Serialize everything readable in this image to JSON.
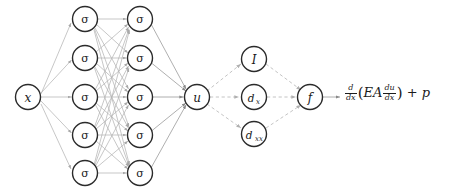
{
  "diagram": {
    "type": "neural-network-graph",
    "colors": {
      "background": "#ffffff",
      "node_stroke": "#2b2b2b",
      "node_fill": "#ffffff",
      "edge_solid": "#b4b4b4",
      "edge_dashed": "#bdbdbd",
      "text": "#1a1a1a"
    },
    "input": {
      "label": "x",
      "name": "input-node-x",
      "cx": 28,
      "cy": 97,
      "r": 12.5
    },
    "hidden_layers": [
      {
        "name": "hidden-layer-1",
        "cx": 85,
        "node_label": "σ",
        "nodes": [
          {
            "cy": 19
          },
          {
            "cy": 58
          },
          {
            "cy": 97
          },
          {
            "cy": 135
          },
          {
            "cy": 173
          }
        ]
      },
      {
        "name": "hidden-layer-2",
        "cx": 140,
        "node_label": "σ",
        "nodes": [
          {
            "cy": 19
          },
          {
            "cy": 58
          },
          {
            "cy": 97
          },
          {
            "cy": 135
          },
          {
            "cy": 173
          }
        ]
      }
    ],
    "output": {
      "label": "u",
      "name": "output-node-u",
      "cx": 197,
      "cy": 97,
      "r": 12.5
    },
    "operator_nodes": [
      {
        "name": "operator-node-identity",
        "label": "I",
        "sub": "",
        "cx": 254,
        "cy": 59,
        "r": 12.5
      },
      {
        "name": "operator-node-dx",
        "label": "d",
        "sub": "x",
        "cx": 254,
        "cy": 97,
        "r": 12.5
      },
      {
        "name": "operator-node-dxx",
        "label": "d",
        "sub": "xx",
        "cx": 254,
        "cy": 134,
        "r": 12.5
      }
    ],
    "residual": {
      "label": "f",
      "name": "residual-node-f",
      "cx": 310,
      "cy": 97,
      "r": 12.5
    },
    "formula": {
      "name": "governing-equation",
      "text": "d/dx(EA du/dx) + p",
      "outer_num": "d",
      "outer_den": "dx",
      "open_paren": "(",
      "coefficients": "EA",
      "inner_num": "du",
      "inner_den": "dx",
      "close_paren": ")",
      "plus": "+",
      "source_term": "p"
    },
    "edge_styles": {
      "network_edges": "solid-gray-arrow",
      "operator_edges": "dashed-gray-arrow"
    }
  }
}
